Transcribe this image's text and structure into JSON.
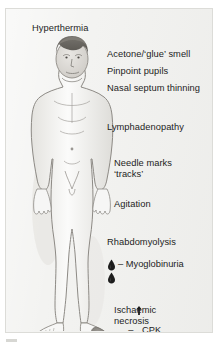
{
  "diagram": {
    "background_color": "#f3f3f1",
    "text_color": "#1d1d1d",
    "figure": {
      "name": "anterior full-body human figure",
      "hair_color": "#6b6863",
      "skin_line_color": "#8d8a85",
      "shading_color": "#dcdcd8",
      "necrosis_color": "#8e8b86"
    },
    "labels": {
      "hyperthermia": "Hyperthermia",
      "acetone": "Acetone/‘glue’ smell",
      "pupils": "Pinpoint pupils",
      "septum": "Nasal septum thinning",
      "lymph": "Lymphadenopathy",
      "needle_line1": "Needle marks",
      "needle_line2": "‘tracks’",
      "agitation": "Agitation",
      "rhabdo": "Rhabdomyolysis",
      "myoglobinuria": "– Myoglobinuria",
      "cpk_dash": "–",
      "cpk": "CPK",
      "ischaemic_line1": "Ischaemic",
      "ischaemic_line2": "necrosis"
    },
    "icons": {
      "blood_drop": "blood-drop-icon",
      "up_arrow": "up-arrow-icon"
    }
  }
}
